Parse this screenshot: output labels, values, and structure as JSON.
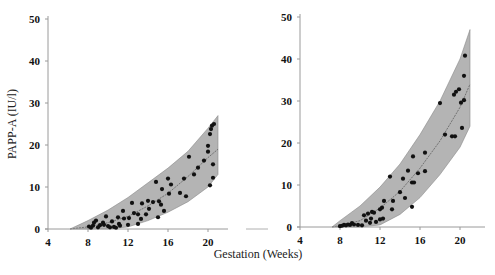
{
  "chart_data": [
    {
      "type": "scatter",
      "panel": "left",
      "title": "",
      "xlabel": "Gestation (Weeks)",
      "ylabel": "PAPP-A (IU/l)",
      "xlim": [
        4,
        21.5
      ],
      "ylim": [
        0,
        50
      ],
      "xticks": [
        4,
        8,
        12,
        16,
        20
      ],
      "yticks": [
        0,
        10,
        20,
        30,
        40,
        50
      ],
      "grid": false,
      "legend": null,
      "band": {
        "description": "shaded reference range with central fitted curve",
        "x": [
          6.2,
          8,
          10,
          12,
          14,
          16,
          18,
          20,
          21
        ],
        "lower": [
          0,
          0,
          0,
          0.5,
          2,
          4,
          6.5,
          10,
          13
        ],
        "median": [
          0,
          0.5,
          1.5,
          3,
          5.5,
          8.5,
          12.5,
          17,
          19
        ],
        "upper": [
          0,
          2,
          4.5,
          7.5,
          11,
          14.5,
          18.5,
          24,
          27
        ]
      },
      "points": [
        {
          "x": 8.1,
          "y": 0.6
        },
        {
          "x": 8.3,
          "y": 0.3
        },
        {
          "x": 8.5,
          "y": 0.8
        },
        {
          "x": 8.6,
          "y": 1.5
        },
        {
          "x": 8.8,
          "y": 2.0
        },
        {
          "x": 9.0,
          "y": 0.4
        },
        {
          "x": 9.2,
          "y": 0.9
        },
        {
          "x": 9.5,
          "y": 1.5
        },
        {
          "x": 9.6,
          "y": 1.0
        },
        {
          "x": 9.8,
          "y": 3.0
        },
        {
          "x": 10.0,
          "y": 0.7
        },
        {
          "x": 10.2,
          "y": 0.4
        },
        {
          "x": 10.4,
          "y": 1.8
        },
        {
          "x": 10.6,
          "y": 0.5
        },
        {
          "x": 10.8,
          "y": 0.3
        },
        {
          "x": 11.0,
          "y": 2.8
        },
        {
          "x": 11.1,
          "y": 1.2
        },
        {
          "x": 11.2,
          "y": 0.8
        },
        {
          "x": 11.5,
          "y": 4.3
        },
        {
          "x": 11.6,
          "y": 2.5
        },
        {
          "x": 12.0,
          "y": 1.0
        },
        {
          "x": 12.1,
          "y": 2.6
        },
        {
          "x": 12.4,
          "y": 6.2
        },
        {
          "x": 12.6,
          "y": 3.8
        },
        {
          "x": 13.0,
          "y": 1.2
        },
        {
          "x": 13.0,
          "y": 3.5
        },
        {
          "x": 13.3,
          "y": 2.4
        },
        {
          "x": 13.4,
          "y": 6.1
        },
        {
          "x": 13.8,
          "y": 3.5
        },
        {
          "x": 14.0,
          "y": 6.7
        },
        {
          "x": 14.1,
          "y": 4.8
        },
        {
          "x": 14.5,
          "y": 6.4
        },
        {
          "x": 14.8,
          "y": 11.2
        },
        {
          "x": 15.0,
          "y": 2.8
        },
        {
          "x": 15.1,
          "y": 6.6
        },
        {
          "x": 15.3,
          "y": 5.8
        },
        {
          "x": 15.4,
          "y": 9.5
        },
        {
          "x": 15.6,
          "y": 4.3
        },
        {
          "x": 16.0,
          "y": 12.0
        },
        {
          "x": 16.1,
          "y": 8.4
        },
        {
          "x": 16.3,
          "y": 10.6
        },
        {
          "x": 17.2,
          "y": 8.6
        },
        {
          "x": 17.6,
          "y": 12.0
        },
        {
          "x": 17.8,
          "y": 7.8
        },
        {
          "x": 18.1,
          "y": 17.2
        },
        {
          "x": 18.6,
          "y": 13.0
        },
        {
          "x": 19.0,
          "y": 14.6
        },
        {
          "x": 19.6,
          "y": 16.3
        },
        {
          "x": 20.0,
          "y": 19.8
        },
        {
          "x": 20.0,
          "y": 18.4
        },
        {
          "x": 20.2,
          "y": 10.4
        },
        {
          "x": 20.2,
          "y": 22.6
        },
        {
          "x": 20.5,
          "y": 15.4
        },
        {
          "x": 20.5,
          "y": 12.2
        },
        {
          "x": 20.3,
          "y": 23.8
        },
        {
          "x": 20.6,
          "y": 25.0
        },
        {
          "x": 20.4,
          "y": 24.6
        }
      ]
    },
    {
      "type": "scatter",
      "panel": "right",
      "title": "",
      "xlabel": "Gestation (Weeks)",
      "ylabel": "",
      "xlim": [
        4,
        21.5
      ],
      "ylim": [
        0,
        50
      ],
      "xticks": [
        4,
        8,
        12,
        16,
        20
      ],
      "yticks": [
        0,
        10,
        20,
        30,
        40,
        50
      ],
      "grid": false,
      "legend": null,
      "band": {
        "description": "shaded reference range with central fitted curve",
        "x": [
          7.2,
          8,
          10,
          12,
          14,
          16,
          18,
          20,
          21
        ],
        "lower": [
          0,
          0,
          0,
          0.5,
          3,
          7,
          12.5,
          19,
          24
        ],
        "median": [
          0,
          0.3,
          1.5,
          4.5,
          8.5,
          14,
          20.5,
          28.5,
          34
        ],
        "upper": [
          0,
          1.5,
          5,
          9.5,
          15,
          22,
          30,
          40,
          47
        ]
      },
      "points": [
        {
          "x": 8.0,
          "y": 0.2
        },
        {
          "x": 8.2,
          "y": 0.3
        },
        {
          "x": 8.4,
          "y": 0.5
        },
        {
          "x": 8.6,
          "y": 0.4
        },
        {
          "x": 8.8,
          "y": 0.6
        },
        {
          "x": 9.0,
          "y": 0.5
        },
        {
          "x": 9.2,
          "y": 0.9
        },
        {
          "x": 9.4,
          "y": 0.6
        },
        {
          "x": 9.8,
          "y": 0.5
        },
        {
          "x": 10.2,
          "y": 0.4
        },
        {
          "x": 10.4,
          "y": 2.8
        },
        {
          "x": 10.6,
          "y": 1.5
        },
        {
          "x": 10.8,
          "y": 3.2
        },
        {
          "x": 11.0,
          "y": 1.0
        },
        {
          "x": 11.1,
          "y": 2.0
        },
        {
          "x": 11.2,
          "y": 3.6
        },
        {
          "x": 11.4,
          "y": 3.4
        },
        {
          "x": 11.6,
          "y": 1.2
        },
        {
          "x": 12.0,
          "y": 4.2
        },
        {
          "x": 12.0,
          "y": 1.8
        },
        {
          "x": 12.2,
          "y": 4.6
        },
        {
          "x": 12.3,
          "y": 2.0
        },
        {
          "x": 12.4,
          "y": 6.2
        },
        {
          "x": 13.0,
          "y": 12.0
        },
        {
          "x": 13.2,
          "y": 4.2
        },
        {
          "x": 13.3,
          "y": 6.2
        },
        {
          "x": 14.0,
          "y": 8.3
        },
        {
          "x": 14.3,
          "y": 11.5
        },
        {
          "x": 14.5,
          "y": 6.9
        },
        {
          "x": 14.8,
          "y": 13.4
        },
        {
          "x": 15.2,
          "y": 4.8
        },
        {
          "x": 15.2,
          "y": 10.6
        },
        {
          "x": 15.4,
          "y": 10.6
        },
        {
          "x": 15.3,
          "y": 16.8
        },
        {
          "x": 15.8,
          "y": 12.8
        },
        {
          "x": 16.5,
          "y": 17.7
        },
        {
          "x": 16.5,
          "y": 13.3
        },
        {
          "x": 18.0,
          "y": 29.5
        },
        {
          "x": 18.5,
          "y": 22.0
        },
        {
          "x": 19.2,
          "y": 21.6
        },
        {
          "x": 19.5,
          "y": 21.6
        },
        {
          "x": 19.4,
          "y": 31.5
        },
        {
          "x": 19.6,
          "y": 32.2
        },
        {
          "x": 19.9,
          "y": 32.8
        },
        {
          "x": 20.1,
          "y": 29.6
        },
        {
          "x": 20.2,
          "y": 23.6
        },
        {
          "x": 20.4,
          "y": 30.2
        },
        {
          "x": 20.4,
          "y": 36.0
        },
        {
          "x": 20.5,
          "y": 40.8
        }
      ]
    }
  ],
  "axes": {
    "y_title": "PAPP-A (IU/l)",
    "x_title": "Gestation (Weeks)",
    "y_ticks": [
      "0",
      "10",
      "20",
      "30",
      "40",
      "50"
    ],
    "x_ticks": [
      "4",
      "8",
      "12",
      "16",
      "20"
    ]
  },
  "colors": {
    "band_fill": "#b4b4b4",
    "band_edge": "#8a8a8a",
    "median_line": "#555555",
    "point": "#111111",
    "axis": "#9a9a9a",
    "text": "#111111"
  }
}
